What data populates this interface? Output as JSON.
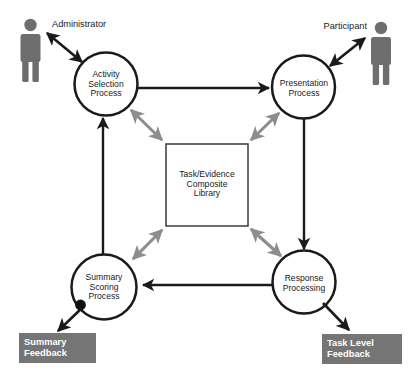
{
  "diagram": {
    "colors": {
      "stroke_dark": "#1a1a1a",
      "arrow_gray": "#8d8d8d",
      "actor_gray": "#6e6e6e",
      "feedback_box": "#757575",
      "feedback_text": "#ffffff",
      "background": "#ffffff"
    },
    "actors": [
      {
        "id": "administrator",
        "label": "Administrator",
        "position": "top-left"
      },
      {
        "id": "participant",
        "label": "Participant",
        "position": "top-right"
      }
    ],
    "processes": [
      {
        "id": "activity-selection-process",
        "label": "Activity\nSelection\nProcess",
        "position": "top-left"
      },
      {
        "id": "presentation-process",
        "label": "Presentation\nProcess",
        "position": "top-right"
      },
      {
        "id": "response-processing",
        "label": "Response\nProcessing",
        "position": "bottom-right"
      },
      {
        "id": "summary-scoring-process",
        "label": "Summary\nScoring\nProcess",
        "position": "bottom-left"
      }
    ],
    "library": {
      "id": "task-evidence-composite-library",
      "label": "Task/Evidence\nComposite\nLibrary"
    },
    "outputs": [
      {
        "id": "summary-feedback",
        "label": "Summary\nFeedback",
        "position": "bottom-left"
      },
      {
        "id": "task-level-feedback",
        "label": "Task Level\nFeedback",
        "position": "bottom-right"
      }
    ],
    "connections": [
      {
        "from": "administrator",
        "to": "activity-selection-process",
        "style": "bidirectional",
        "color": "black"
      },
      {
        "from": "participant",
        "to": "presentation-process",
        "style": "bidirectional",
        "color": "black"
      },
      {
        "from": "activity-selection-process",
        "to": "presentation-process",
        "style": "directional",
        "color": "black"
      },
      {
        "from": "presentation-process",
        "to": "response-processing",
        "style": "directional",
        "color": "black"
      },
      {
        "from": "response-processing",
        "to": "summary-scoring-process",
        "style": "directional",
        "color": "black"
      },
      {
        "from": "summary-scoring-process",
        "to": "activity-selection-process",
        "style": "directional",
        "color": "black"
      },
      {
        "from": "activity-selection-process",
        "to": "task-evidence-composite-library",
        "style": "bidirectional",
        "color": "gray"
      },
      {
        "from": "presentation-process",
        "to": "task-evidence-composite-library",
        "style": "bidirectional",
        "color": "gray"
      },
      {
        "from": "response-processing",
        "to": "task-evidence-composite-library",
        "style": "bidirectional",
        "color": "gray"
      },
      {
        "from": "summary-scoring-process",
        "to": "task-evidence-composite-library",
        "style": "bidirectional",
        "color": "gray"
      },
      {
        "from": "summary-scoring-process",
        "to": "summary-feedback",
        "style": "directional",
        "color": "black"
      },
      {
        "from": "response-processing",
        "to": "task-level-feedback",
        "style": "directional",
        "color": "black"
      }
    ]
  }
}
